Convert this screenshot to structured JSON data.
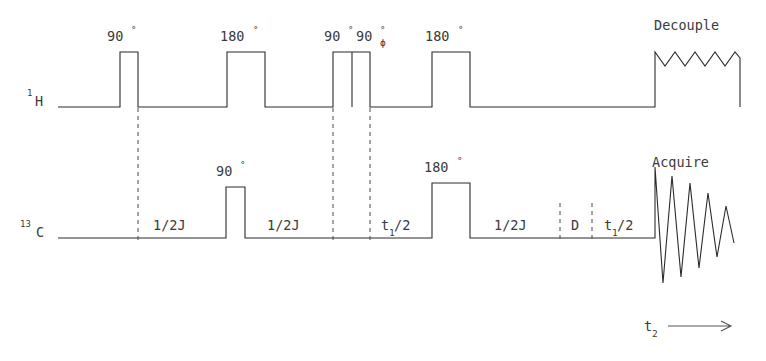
{
  "figure": {
    "type": "pulse-sequence",
    "background_color": "#ffffff",
    "line_color": "#2b2b2b",
    "dash_color": "#4a4a4a"
  },
  "channels": [
    {
      "id": "proton",
      "name": "1H",
      "label_mass": "1",
      "label_element": "H",
      "baseline_y": 107
    },
    {
      "id": "carbon",
      "name": "13C",
      "label_mass": "13",
      "label_element": "C",
      "baseline_y": 238
    }
  ],
  "proton_pulses": [
    {
      "label": "90",
      "degree_symbol": "°",
      "phase": "",
      "x": 120,
      "width": 18
    },
    {
      "label": "180",
      "degree_symbol": "°",
      "phase": "",
      "x": 227,
      "width": 38
    },
    {
      "label": "90",
      "degree_symbol": "°",
      "phase": "",
      "x": 333,
      "width": 18
    },
    {
      "label": "90",
      "degree_symbol": "°",
      "phase": "ϕ",
      "x": 352,
      "width": 18
    },
    {
      "label": "180",
      "degree_symbol": "°",
      "phase": "",
      "x": 432,
      "width": 38
    }
  ],
  "carbon_pulses": [
    {
      "label": "90",
      "degree_symbol": "°",
      "x": 226,
      "width": 19
    },
    {
      "label": "180",
      "degree_symbol": "°",
      "x": 432,
      "width": 38
    }
  ],
  "proton_blocks": [
    {
      "label": "Decouple",
      "kind": "zigzag",
      "x": 655,
      "width": 85
    }
  ],
  "carbon_blocks": [
    {
      "label": "Acquire",
      "kind": "fid",
      "x": 655
    }
  ],
  "interval_labels": [
    {
      "text": "1/2J",
      "x": 175,
      "y": 230
    },
    {
      "text": "1/2J",
      "x": 289,
      "y": 230
    },
    {
      "text": "t",
      "sub": "1",
      "suffix": "/2",
      "x": 392,
      "y": 230
    },
    {
      "text": "1/2J",
      "x": 516,
      "y": 230
    },
    {
      "text": "D",
      "x": 576,
      "y": 230
    },
    {
      "text": "t",
      "sub": "1",
      "suffix": "/2",
      "x": 620,
      "y": 230
    }
  ],
  "axis": {
    "label": "t",
    "label_sub": "2",
    "arrow": "⟶",
    "x": 648,
    "y": 325
  },
  "dashed_dividers": [
    {
      "x": 138,
      "y1": 107,
      "y2": 240
    },
    {
      "x": 333,
      "y1": 107,
      "y2": 240
    },
    {
      "x": 370,
      "y1": 107,
      "y2": 240
    },
    {
      "x": 560,
      "y1": 205,
      "y2": 240
    },
    {
      "x": 592,
      "y1": 205,
      "y2": 240
    }
  ]
}
